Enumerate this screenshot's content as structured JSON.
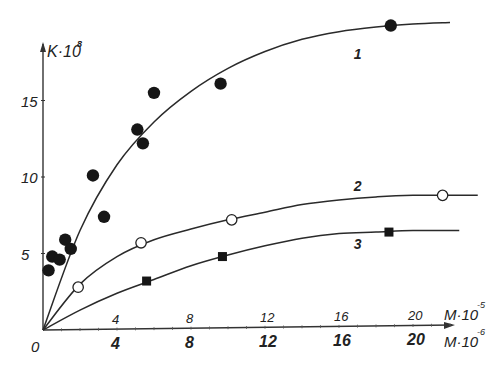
{
  "chart_data": {
    "type": "scatter",
    "title": "",
    "xlabel": "M·10⁻⁵ (upper scale) / M·10⁻⁶ (lower scale)",
    "ylabel": "K·10⁸",
    "y_axis_label": "K·10",
    "y_axis_exp": "8",
    "x_axis_label_upper": "M·10",
    "x_axis_exp_upper": "-5",
    "x_axis_label_lower": "M·10",
    "x_axis_exp_lower": "-6",
    "origin_label": "0",
    "xlim": [
      0,
      23
    ],
    "ylim": [
      0,
      21
    ],
    "x_ticks_upper": [
      "4",
      "8",
      "12",
      "16",
      "20"
    ],
    "x_ticks_lower": [
      "4",
      "8",
      "12",
      "16",
      "20"
    ],
    "x_tick_values": [
      4,
      8,
      12,
      16,
      20
    ],
    "y_ticks": [
      "5",
      "10",
      "15"
    ],
    "y_tick_values": [
      5,
      10,
      15
    ],
    "grid": false,
    "legend": "curve numbers labeled inline",
    "series": [
      {
        "name": "1",
        "marker": "filled-circle",
        "points": [
          [
            0.3,
            3.9
          ],
          [
            0.5,
            4.8
          ],
          [
            0.9,
            4.6
          ],
          [
            1.2,
            5.9
          ],
          [
            1.5,
            5.3
          ],
          [
            2.7,
            10.1
          ],
          [
            3.3,
            7.4
          ],
          [
            5.1,
            13.1
          ],
          [
            5.4,
            12.2
          ],
          [
            6.0,
            15.5
          ],
          [
            9.6,
            16.1
          ],
          [
            18.8,
            19.9
          ]
        ],
        "curve": [
          [
            0,
            0
          ],
          [
            2,
            6.5
          ],
          [
            4,
            10.8
          ],
          [
            6,
            13.6
          ],
          [
            8,
            15.6
          ],
          [
            10,
            17.1
          ],
          [
            12,
            18.2
          ],
          [
            14,
            19.0
          ],
          [
            16,
            19.5
          ],
          [
            18,
            19.8
          ],
          [
            20,
            20.0
          ],
          [
            22,
            20.1
          ]
        ],
        "label_pos": [
          16.8,
          17.7
        ]
      },
      {
        "name": "2",
        "marker": "open-circle",
        "points": [
          [
            1.9,
            2.8
          ],
          [
            5.3,
            5.7
          ],
          [
            10.2,
            7.2
          ],
          [
            21.6,
            8.8
          ]
        ],
        "curve": [
          [
            0,
            0
          ],
          [
            2,
            3.0
          ],
          [
            4,
            4.8
          ],
          [
            6,
            5.9
          ],
          [
            8,
            6.6
          ],
          [
            10,
            7.2
          ],
          [
            12,
            7.7
          ],
          [
            14,
            8.2
          ],
          [
            16,
            8.5
          ],
          [
            18,
            8.7
          ],
          [
            20,
            8.8
          ],
          [
            23.5,
            8.8
          ]
        ],
        "label_pos": [
          16.8,
          9.1
        ]
      },
      {
        "name": "3",
        "marker": "filled-square",
        "points": [
          [
            5.6,
            3.2
          ],
          [
            9.7,
            4.8
          ],
          [
            18.7,
            6.4
          ]
        ],
        "curve": [
          [
            0,
            0
          ],
          [
            2,
            1.3
          ],
          [
            4,
            2.4
          ],
          [
            6,
            3.3
          ],
          [
            8,
            4.2
          ],
          [
            10,
            4.9
          ],
          [
            12,
            5.5
          ],
          [
            14,
            6.0
          ],
          [
            16,
            6.3
          ],
          [
            18,
            6.4
          ],
          [
            20,
            6.5
          ],
          [
            22.5,
            6.5
          ]
        ],
        "label_pos": [
          16.8,
          5.3
        ]
      }
    ]
  }
}
